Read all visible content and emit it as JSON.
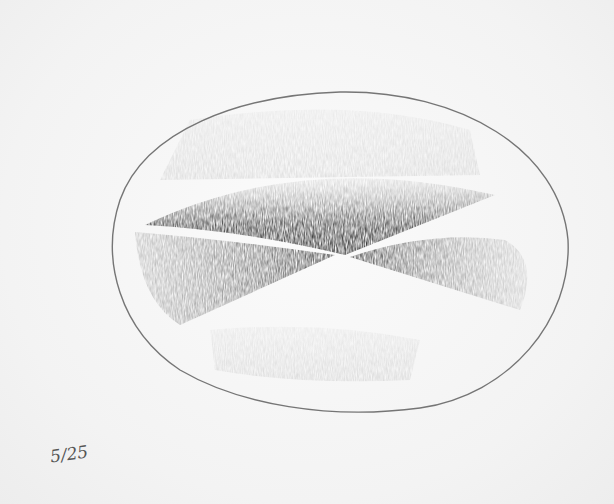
{
  "artwork": {
    "description": "Pencil drawing of an oval with shaded sectors forming an X shape",
    "annotation": "5/25",
    "colors": {
      "paper": "#f7f7f7",
      "graphite": "#333333"
    }
  }
}
